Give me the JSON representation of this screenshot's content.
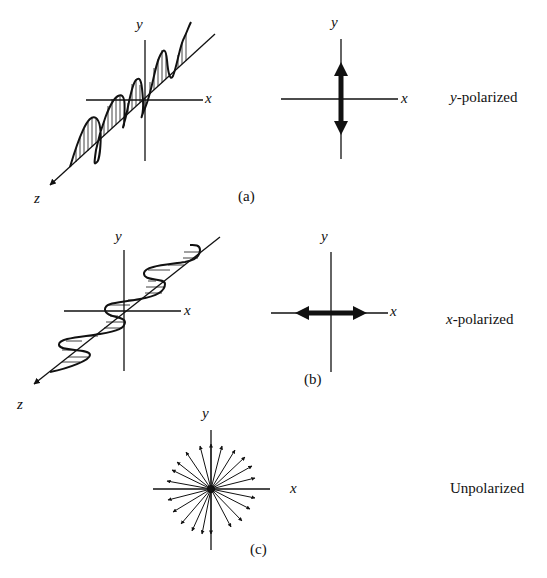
{
  "panels": [
    {
      "id": "a",
      "caption": "(a)",
      "description_label_var": "y",
      "description_label_rest": "-polarized",
      "wave_axes": {
        "x": "x",
        "y": "y",
        "z": "z"
      },
      "vector_axes": {
        "x": "x",
        "y": "y"
      },
      "vector_direction": "vertical"
    },
    {
      "id": "b",
      "caption": "(b)",
      "description_label_var": "x",
      "description_label_rest": "-polarized",
      "wave_axes": {
        "x": "x",
        "y": "y",
        "z": "z"
      },
      "vector_axes": {
        "x": "x",
        "y": "y"
      },
      "vector_direction": "horizontal"
    },
    {
      "id": "c",
      "caption": "(c)",
      "description_label": "Unpolarized",
      "vector_axes": {
        "x": "x",
        "y": "y"
      },
      "vector_direction": "all"
    }
  ]
}
